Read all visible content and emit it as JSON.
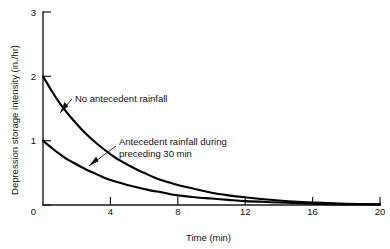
{
  "chart_data": {
    "type": "line",
    "title": "",
    "xlabel": "Time (min)",
    "ylabel": "Depression storage intensity (in./hr)",
    "xlim": [
      0,
      20
    ],
    "ylim": [
      0,
      3
    ],
    "xticks": [
      "0",
      "4",
      "8",
      "12",
      "16",
      "20"
    ],
    "xtick_values": [
      0,
      4,
      8,
      12,
      16,
      20
    ],
    "yticks": [
      "0",
      "1",
      "2",
      "3"
    ],
    "ytick_values": [
      0,
      1,
      2,
      3
    ],
    "grid": false,
    "legend_position": "inline-annotations",
    "series": [
      {
        "name": "No antecedent rainfall",
        "annotation": "No antecedent rainfall",
        "x": [
          0,
          0.5,
          1,
          1.5,
          2,
          2.5,
          3,
          3.5,
          4,
          4.5,
          5,
          5.5,
          6,
          6.5,
          7,
          7.5,
          8,
          9,
          10,
          11,
          12,
          14,
          16,
          18,
          20
        ],
        "values": [
          2.0,
          1.78,
          1.58,
          1.41,
          1.26,
          1.12,
          1.0,
          0.89,
          0.79,
          0.7,
          0.63,
          0.56,
          0.5,
          0.44,
          0.39,
          0.35,
          0.31,
          0.25,
          0.19,
          0.15,
          0.12,
          0.07,
          0.04,
          0.02,
          0.01
        ]
      },
      {
        "name": "Antecedent rainfall during preceding 30 min",
        "annotation_line1": "Antecedent rainfall during",
        "annotation_line2": "preceding 30 min",
        "x": [
          0,
          0.5,
          1,
          1.5,
          2,
          2.5,
          3,
          3.5,
          4,
          4.5,
          5,
          5.5,
          6,
          6.5,
          7,
          7.5,
          8,
          9,
          10,
          11,
          12,
          14,
          16,
          18,
          20
        ],
        "values": [
          1.0,
          0.89,
          0.79,
          0.7,
          0.63,
          0.56,
          0.5,
          0.44,
          0.39,
          0.35,
          0.31,
          0.28,
          0.25,
          0.22,
          0.2,
          0.17,
          0.15,
          0.12,
          0.1,
          0.08,
          0.06,
          0.04,
          0.02,
          0.01,
          0.01
        ]
      }
    ],
    "colors": {
      "curve": "#000000",
      "axis": "#1a1a1a",
      "text": "#111111",
      "background": "#ffffff"
    }
  }
}
